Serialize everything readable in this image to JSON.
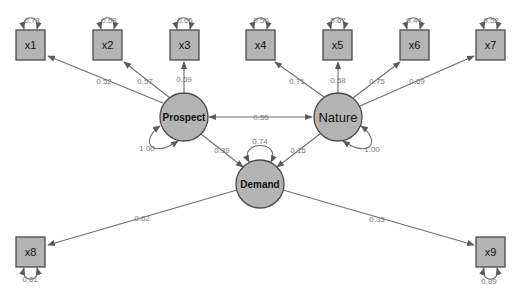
{
  "diagram": {
    "type": "structural-equation-model",
    "colors": {
      "node_fill": "#b4b4b4",
      "node_stroke": "#4a4a4a",
      "edge": "#6f6f6f",
      "label": "#7a7a7a"
    },
    "latents": [
      {
        "id": "prospect",
        "label": "Prospect",
        "variance": "1.00"
      },
      {
        "id": "nature",
        "label": "Nature",
        "variance": "1.00"
      },
      {
        "id": "demand",
        "label": "Demand",
        "variance": "0.74"
      }
    ],
    "indicators": [
      {
        "id": "x1",
        "label": "x1",
        "residual": "0.73",
        "loading": "0.52",
        "factor": "Prospect"
      },
      {
        "id": "x2",
        "label": "x2",
        "residual": "0.68",
        "loading": "0.57",
        "factor": "Prospect"
      },
      {
        "id": "x3",
        "label": "x3",
        "residual": "0.65",
        "loading": "0.59",
        "factor": "Prospect"
      },
      {
        "id": "x4",
        "label": "x4",
        "residual": "0.50",
        "loading": "0.71",
        "factor": "Nature"
      },
      {
        "id": "x5",
        "label": "x5",
        "residual": "0.67",
        "loading": "0.58",
        "factor": "Nature"
      },
      {
        "id": "x6",
        "label": "x6",
        "residual": "0.44",
        "loading": "0.75",
        "factor": "Nature"
      },
      {
        "id": "x7",
        "label": "x7",
        "residual": "0.52",
        "loading": "0.69",
        "factor": "Nature"
      },
      {
        "id": "x8",
        "label": "x8",
        "residual": "0.61",
        "loading": "0.62",
        "factor": "Demand"
      },
      {
        "id": "x9",
        "label": "x9",
        "residual": "0.89",
        "loading": "0.33",
        "factor": "Demand"
      }
    ],
    "covariances": [
      {
        "from": "Prospect",
        "to": "Nature",
        "value": "0.55"
      }
    ],
    "regressions": [
      {
        "from": "Prospect",
        "to": "Demand",
        "value": "0.39"
      },
      {
        "from": "Nature",
        "to": "Demand",
        "value": "0.15"
      }
    ]
  }
}
